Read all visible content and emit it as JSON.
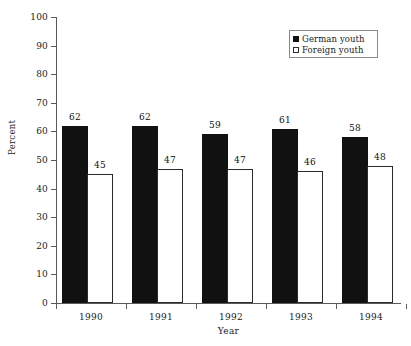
{
  "chart_data": {
    "type": "bar",
    "title": "",
    "xlabel": "Year",
    "ylabel": "Percent",
    "categories": [
      "1990",
      "1991",
      "1992",
      "1993",
      "1994"
    ],
    "series": [
      {
        "name": "German youth",
        "values": [
          62,
          62,
          59,
          61,
          58
        ],
        "color": "#111111",
        "style": "filled"
      },
      {
        "name": "Foreign youth",
        "values": [
          45,
          47,
          47,
          46,
          48
        ],
        "color": "#ffffff",
        "style": "open"
      }
    ],
    "ylim": [
      0,
      100
    ],
    "ytick_labels": [
      "0",
      "10",
      "20",
      "30",
      "40",
      "50",
      "60",
      "70",
      "80",
      "90",
      "100"
    ],
    "ytick_values": [
      0,
      10,
      20,
      30,
      40,
      50,
      60,
      70,
      80,
      90,
      100
    ],
    "grid": false,
    "legend_position": "top-right",
    "data_labels": true
  },
  "legend": {
    "entries": [
      {
        "label": "German youth",
        "swatch": "filled-square-icon"
      },
      {
        "label": "Foreign youth",
        "swatch": "open-square-icon"
      }
    ]
  },
  "axes": {
    "y_title": "Percent",
    "x_title": "Year"
  }
}
